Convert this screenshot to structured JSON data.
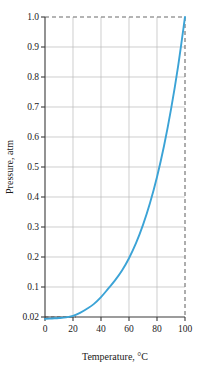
{
  "chart_data": {
    "type": "line",
    "title": "",
    "xlabel": "Temperature, °C",
    "ylabel": "Pressure, atm",
    "xlim": [
      0,
      100
    ],
    "ylim": [
      0.02,
      1.0
    ],
    "grid": true,
    "legend_position": "none",
    "x_ticks": [
      "0",
      "20",
      "40",
      "60",
      "80",
      "100"
    ],
    "x_tick_values": [
      0,
      20,
      40,
      60,
      80,
      100
    ],
    "y_ticks": [
      "0.02",
      "0.1",
      "0.2",
      "0.3",
      "0.4",
      "0.5",
      "0.6",
      "0.7",
      "0.8",
      "0.9",
      "1.0"
    ],
    "y_tick_values": [
      0.02,
      0.1,
      0.2,
      0.3,
      0.4,
      0.5,
      0.6,
      0.7,
      0.8,
      0.9,
      1.0
    ],
    "series": [
      {
        "name": "Vapor pressure of water",
        "color": "#3ba3d6",
        "x": [
          0,
          5,
          10,
          15,
          20,
          25,
          30,
          35,
          40,
          45,
          50,
          55,
          60,
          65,
          70,
          75,
          80,
          85,
          90,
          95,
          100
        ],
        "y": [
          0.006,
          0.009,
          0.012,
          0.017,
          0.023,
          0.031,
          0.042,
          0.055,
          0.073,
          0.095,
          0.122,
          0.155,
          0.196,
          0.246,
          0.307,
          0.38,
          0.467,
          0.57,
          0.692,
          0.834,
          1.0
        ]
      }
    ],
    "annotations": [
      {
        "name": "top-dashed-guide",
        "type": "horizontal-dashed-line",
        "value": 1.0,
        "color": "#6b6b6b"
      },
      {
        "name": "right-dashed-guide",
        "type": "vertical-dashed-line",
        "value": 100,
        "color": "#6b6b6b"
      },
      {
        "name": "bottom-dashed-guide",
        "type": "horizontal-dashed-line",
        "value": 0.02,
        "color": "#6b6b6b"
      }
    ]
  },
  "axes": {
    "y_title": "Pressure, atm",
    "x_title": "Temperature, °C"
  },
  "colors": {
    "curve": "#3ba3d6",
    "grid": "#b9b9b9",
    "axis": "#3a3a3a",
    "dashed": "#6b6b6b",
    "background": "#ffffff"
  }
}
